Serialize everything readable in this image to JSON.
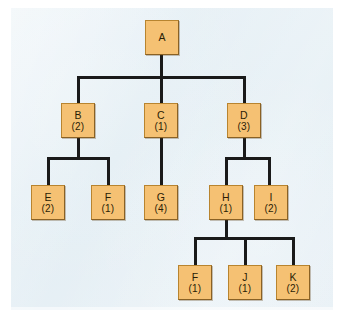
{
  "diagram": {
    "type": "tree",
    "title": "",
    "colors": {
      "panel_background": "#e6f0f5",
      "node_fill": "#f5c173",
      "node_border": "#b8842f",
      "edge_line": "#1a1a1a",
      "text": "#2a1d06"
    },
    "nodes": [
      {
        "id": "A",
        "label": "A",
        "count": "",
        "level": 0,
        "x": 162,
        "y": 20
      },
      {
        "id": "B",
        "label": "B",
        "count": "(2)",
        "level": 1,
        "x": 78,
        "y": 103
      },
      {
        "id": "C",
        "label": "C",
        "count": "(1)",
        "level": 1,
        "x": 161,
        "y": 103
      },
      {
        "id": "D",
        "label": "D",
        "count": "(3)",
        "level": 1,
        "x": 244,
        "y": 103
      },
      {
        "id": "E",
        "label": "E",
        "count": "(2)",
        "level": 2,
        "x": 48,
        "y": 185
      },
      {
        "id": "F1",
        "label": "F",
        "count": "(1)",
        "level": 2,
        "x": 108,
        "y": 185
      },
      {
        "id": "G",
        "label": "G",
        "count": "(4)",
        "level": 2,
        "x": 161,
        "y": 185
      },
      {
        "id": "H",
        "label": "H",
        "count": "(1)",
        "level": 2,
        "x": 226,
        "y": 185
      },
      {
        "id": "I",
        "label": "I",
        "count": "(2)",
        "level": 2,
        "x": 271,
        "y": 185
      },
      {
        "id": "F2",
        "label": "F",
        "count": "(1)",
        "level": 3,
        "x": 195,
        "y": 265
      },
      {
        "id": "J",
        "label": "J",
        "count": "(1)",
        "level": 3,
        "x": 245,
        "y": 265
      },
      {
        "id": "K",
        "label": "K",
        "count": "(2)",
        "level": 3,
        "x": 293,
        "y": 265
      }
    ],
    "edges": [
      {
        "from": "A",
        "to": "B"
      },
      {
        "from": "A",
        "to": "C"
      },
      {
        "from": "A",
        "to": "D"
      },
      {
        "from": "B",
        "to": "E"
      },
      {
        "from": "B",
        "to": "F1"
      },
      {
        "from": "C",
        "to": "G"
      },
      {
        "from": "D",
        "to": "H"
      },
      {
        "from": "D",
        "to": "I"
      },
      {
        "from": "H",
        "to": "F2"
      },
      {
        "from": "H",
        "to": "J"
      },
      {
        "from": "H",
        "to": "K"
      }
    ]
  }
}
